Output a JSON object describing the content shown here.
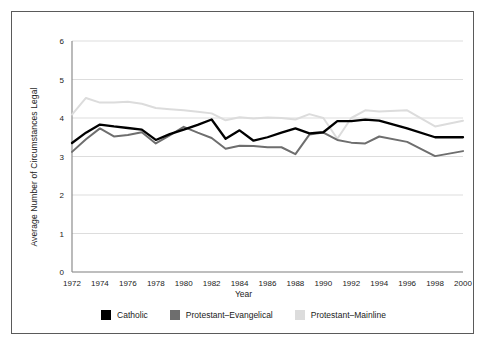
{
  "chart_data": {
    "type": "line",
    "title": "",
    "xlabel": "Year",
    "ylabel": "Average Number of Circumstances Legal",
    "xlim": [
      1972,
      2000
    ],
    "ylim": [
      0,
      6
    ],
    "ytick_labels": [
      "0",
      "1",
      "2",
      "3",
      "4",
      "5",
      "6"
    ],
    "yticks": [
      0,
      1,
      2,
      3,
      4,
      5,
      6
    ],
    "xtick_labels": [
      "1972",
      "1974",
      "1976",
      "1978",
      "1980",
      "1982",
      "1984",
      "1986",
      "1988",
      "1990",
      "1992",
      "1994",
      "1996",
      "1998",
      "2000"
    ],
    "xticks": [
      1972,
      1974,
      1976,
      1978,
      1980,
      1982,
      1984,
      1986,
      1988,
      1990,
      1992,
      1994,
      1996,
      1998,
      2000
    ],
    "grid": "horizontal",
    "legend_position": "bottom",
    "x": [
      1972,
      1973,
      1974,
      1975,
      1976,
      1977,
      1978,
      1979,
      1980,
      1981,
      1982,
      1983,
      1984,
      1985,
      1986,
      1987,
      1988,
      1989,
      1990,
      1991,
      1992,
      1993,
      1994,
      1996,
      1998,
      2000
    ],
    "series": [
      {
        "name": "Catholic",
        "color": "#000000",
        "values": [
          3.35,
          3.62,
          3.83,
          3.78,
          3.74,
          3.7,
          3.43,
          3.58,
          3.7,
          3.82,
          3.96,
          3.46,
          3.68,
          3.41,
          3.5,
          3.62,
          3.73,
          3.6,
          3.63,
          3.92,
          3.92,
          3.96,
          3.93,
          3.73,
          3.5,
          3.5
        ]
      },
      {
        "name": "Protestant-Evangelical",
        "color": "#6e6e6e",
        "values": [
          3.12,
          3.45,
          3.73,
          3.52,
          3.56,
          3.63,
          3.34,
          3.55,
          3.77,
          3.62,
          3.48,
          3.2,
          3.28,
          3.27,
          3.24,
          3.24,
          3.06,
          3.57,
          3.62,
          3.43,
          3.36,
          3.34,
          3.52,
          3.38,
          3.01,
          3.14
        ]
      },
      {
        "name": "Protestant-Mainline",
        "color": "#dcdcdc",
        "values": [
          4.09,
          4.52,
          4.4,
          4.4,
          4.42,
          4.37,
          4.26,
          4.23,
          4.2,
          4.16,
          4.12,
          3.94,
          4.02,
          3.99,
          4.01,
          4.0,
          3.96,
          4.1,
          4.0,
          3.46,
          4.0,
          4.2,
          4.17,
          4.2,
          3.78,
          3.93
        ]
      }
    ]
  },
  "legend": {
    "items": [
      {
        "label": "Catholic",
        "color": "#000000"
      },
      {
        "label": "Protestant–Evangelical",
        "color": "#6e6e6e"
      },
      {
        "label": "Protestant–Mainline",
        "color": "#dcdcdc"
      }
    ]
  }
}
